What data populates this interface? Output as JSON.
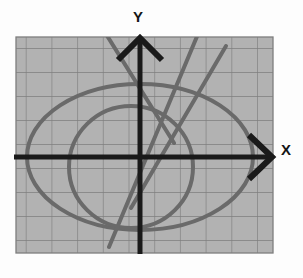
{
  "figure": {
    "kind": "coordinate-grid-graph",
    "background_color": "#fefefe",
    "plot_area": {
      "x": 16,
      "y": 37,
      "width": 257,
      "height": 216,
      "fill_color": "#b2b2b2",
      "grid_color": "#7e7e7e",
      "grid_columns": 10,
      "grid_rows": 9,
      "cell_width": 25.7,
      "cell_height": 24.0
    },
    "axes": {
      "color": "#1a1a1a",
      "stroke_width": 4,
      "origin": {
        "x": 140,
        "y": 157
      },
      "x_axis": {
        "label": "X",
        "from_x": 16,
        "to_x": 272,
        "y": 157,
        "arrow": "open-v-right"
      },
      "y_axis": {
        "label": "Y",
        "x": 140,
        "from_y": 253,
        "to_y": 37,
        "arrow": "open-v-up"
      },
      "arrowhead": {
        "style": "open-chevron",
        "length": 22,
        "spread": 20,
        "stroke_width": 5
      }
    },
    "curves": {
      "color": "#6a6a6a",
      "stroke_width": 4,
      "items": [
        {
          "name": "outer-ellipse",
          "type": "ellipse",
          "cx": 140,
          "cy": 157,
          "rx": 113,
          "ry": 73
        },
        {
          "name": "inner-ellipse",
          "type": "ellipse",
          "cx": 131,
          "cy": 167,
          "rx": 62,
          "ry": 61
        },
        {
          "name": "line-falling",
          "type": "line",
          "x1": 108,
          "y1": 37,
          "x2": 172,
          "y2": 140
        },
        {
          "name": "line-rising-steep",
          "type": "line",
          "x1": 110,
          "y1": 245,
          "x2": 196,
          "y2": 37
        },
        {
          "name": "line-rising-shallow",
          "type": "line",
          "x1": 133,
          "y1": 205,
          "x2": 222,
          "y2": 53
        }
      ]
    },
    "labels": {
      "y": "Y",
      "x": "X"
    }
  }
}
